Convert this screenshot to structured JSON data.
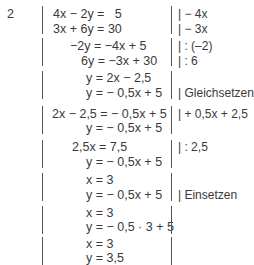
{
  "exercise_number": "2",
  "steps": [
    {
      "lines": [
        "4x − 2y =   5",
        "3x + 6y = 30"
      ],
      "notes": [
        "| − 4x",
        "| − 3x"
      ]
    },
    {
      "lines": [
        "−2y = −4x + 5",
        "6y = −3x + 30"
      ],
      "notes": [
        "| : (–2)",
        "| : 6"
      ]
    },
    {
      "lines": [
        "y = 2x − 2,5",
        "y = − 0,5x + 5"
      ],
      "notes": [
        "",
        "| Gleichsetzen"
      ]
    },
    {
      "lines": [
        "2x − 2,5 = − 0,5x + 5",
        "y = − 0,5x + 5"
      ],
      "notes": [
        "| + 0,5x + 2,5",
        ""
      ]
    },
    {
      "lines": [
        "2,5x = 7,5",
        "y = − 0,5x + 5"
      ],
      "notes": [
        "| : 2,5",
        ""
      ]
    },
    {
      "lines": [
        "x = 3",
        "y = − 0,5x + 5"
      ],
      "notes": [
        "",
        "| Einsetzen"
      ]
    },
    {
      "lines": [
        "x = 3",
        "y = − 0,5 · 3 + 5"
      ],
      "notes": [
        "",
        ""
      ]
    },
    {
      "lines": [
        "x = 3",
        "y = 3,5"
      ],
      "notes": [
        "",
        ""
      ]
    }
  ]
}
